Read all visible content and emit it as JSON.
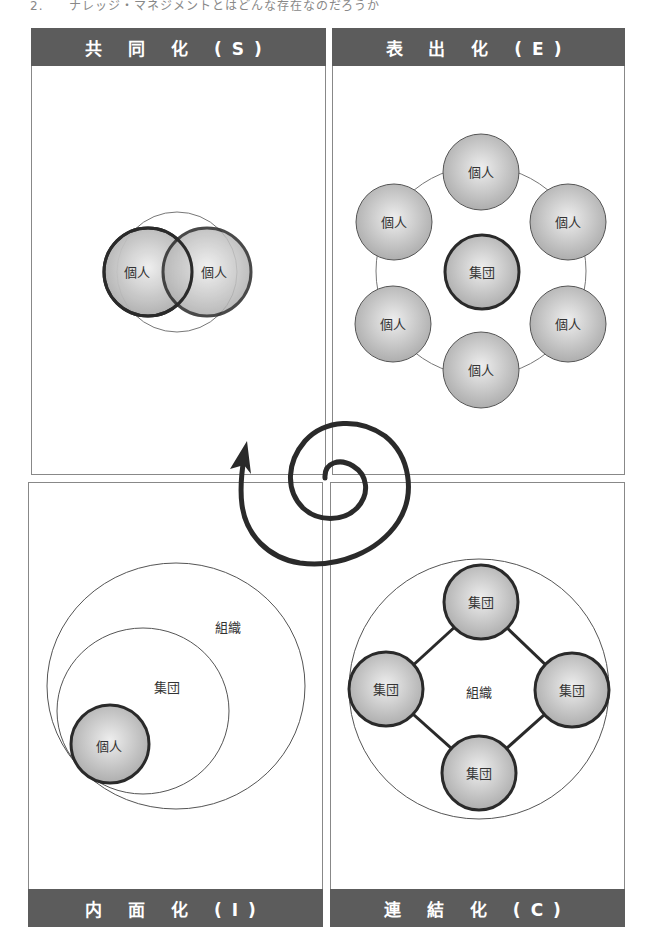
{
  "caption": "2.　　ナレッジ・マネジメントとはどんな存在なのだろうか",
  "panels": {
    "socialization": {
      "title": "共 同 化 (S)",
      "nodes": [
        "個人",
        "個人"
      ]
    },
    "externalization": {
      "title": "表 出 化 (E)",
      "center": "集団",
      "nodes": [
        "個人",
        "個人",
        "個人",
        "個人",
        "個人",
        "個人"
      ]
    },
    "internalization": {
      "title": "内 面 化 (I)",
      "outer": "組織",
      "middle": "集団",
      "inner": "個人"
    },
    "combination": {
      "title": "連 結 化 (C)",
      "center": "組織",
      "nodes": [
        "集団",
        "集団",
        "集団",
        "集団"
      ]
    }
  },
  "spiral": {
    "description": "SECI spiral arrow"
  },
  "colors": {
    "header_bg": "#5c5c5c",
    "node_fill": "#c8c8c8",
    "stroke": "#2a2a2a"
  }
}
